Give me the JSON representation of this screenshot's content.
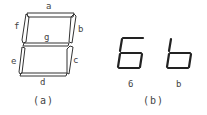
{
  "diagram": {
    "panel_a": {
      "caption": "(a)",
      "segment_labels": {
        "a": "a",
        "b": "b",
        "c": "c",
        "d": "d",
        "e": "e",
        "f": "f",
        "g": "g"
      }
    },
    "panel_b": {
      "caption": "(b)",
      "digits": [
        {
          "char": "6",
          "label": "6",
          "segments_on": [
            "a",
            "f",
            "g",
            "e",
            "d",
            "c"
          ]
        },
        {
          "char": "b",
          "label": "b",
          "segments_on": [
            "f",
            "g",
            "e",
            "d",
            "c"
          ]
        }
      ]
    },
    "colors": {
      "stroke": "#333333",
      "background": "#ffffff"
    }
  }
}
